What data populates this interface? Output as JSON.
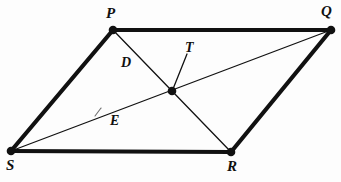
{
  "diagram": {
    "type": "geometry-figure",
    "canvas": {
      "width": 341,
      "height": 182
    },
    "background_color": "#fdfdfd",
    "stroke_color": "#111111",
    "thick_stroke_width": 4.2,
    "thin_stroke_width": 1.3,
    "vertex_dot_radius": 4.2,
    "points": [
      {
        "id": "P",
        "label": "P",
        "x": 113,
        "y": 30,
        "dot": true
      },
      {
        "id": "Q",
        "label": "Q",
        "x": 331,
        "y": 30,
        "dot": true
      },
      {
        "id": "R",
        "label": "R",
        "x": 231,
        "y": 152,
        "dot": true
      },
      {
        "id": "S",
        "label": "S",
        "x": 11,
        "y": 151,
        "dot": true
      },
      {
        "id": "T",
        "label": "T",
        "x": 172,
        "y": 91,
        "dot": true
      }
    ],
    "sides": [
      {
        "id": "PQ",
        "from": "P",
        "to": "Q",
        "weight": "thick"
      },
      {
        "id": "QR",
        "from": "Q",
        "to": "R",
        "weight": "thick"
      },
      {
        "id": "RS",
        "from": "R",
        "to": "S",
        "weight": "thick"
      },
      {
        "id": "SP",
        "from": "S",
        "to": "P",
        "weight": "thick"
      }
    ],
    "diagonals": [
      {
        "id": "PR",
        "from": "P",
        "to": "R",
        "weight": "thin",
        "passes_through": "T"
      },
      {
        "id": "SQ",
        "from": "S",
        "to": "Q",
        "weight": "thin",
        "passes_through": "T"
      }
    ],
    "tick_marks": [
      {
        "id": "tick-SQ",
        "on": "SQ",
        "x": 98,
        "y": 112
      }
    ],
    "leader_lines": [
      {
        "id": "leader-T",
        "from_x": 187,
        "from_y": 54,
        "to_x": 173,
        "to_y": 89,
        "target": "T"
      }
    ],
    "labels": {
      "P": "P",
      "Q": "Q",
      "R": "R",
      "S": "S",
      "T": "T",
      "D": "D",
      "E": "E"
    }
  }
}
